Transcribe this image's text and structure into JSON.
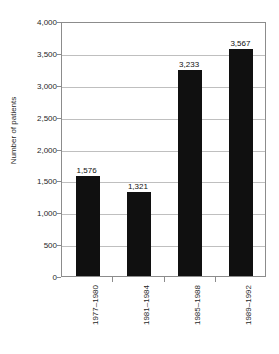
{
  "chart_data": {
    "type": "bar",
    "title": "",
    "xlabel": "",
    "ylabel": "Number of patients",
    "categories": [
      "1977–1980",
      "1981–1984",
      "1985–1988",
      "1989–1992"
    ],
    "values": [
      1576,
      1321,
      3233,
      3567
    ],
    "value_labels": [
      "1,576",
      "1,321",
      "3,233",
      "3,567"
    ],
    "ylim": [
      0,
      4000
    ],
    "ytick_values": [
      0,
      500,
      1000,
      1500,
      2000,
      2500,
      3000,
      3500,
      4000
    ],
    "ytick_labels": [
      "0",
      "500",
      "1,000",
      "1,500",
      "2,000",
      "2,500",
      "3,000",
      "3,500",
      "4,000"
    ],
    "grid": "horizontal",
    "legend": "none",
    "bar_color": "#101010",
    "gridline_color": "#bfbfbf",
    "axis_color": "#8c8c8c",
    "background_color": "#ffffff"
  },
  "figure": {
    "clipped_title_text": ""
  }
}
